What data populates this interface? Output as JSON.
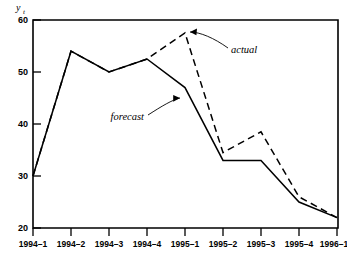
{
  "chart_data": {
    "type": "line",
    "title": "",
    "xlabel": "",
    "ylabel": "y_t",
    "ylabel_display": "y",
    "ylabel_subscript": "t",
    "categories": [
      "1994-1",
      "1994-2",
      "1994-3",
      "1994-4",
      "1995-1",
      "1995-2",
      "1995-3",
      "1995-4",
      "1996-1"
    ],
    "x_tick_labels": [
      "1994–1",
      "1994–2",
      "1994–3",
      "1994–4",
      "1995–1",
      "1995–2",
      "1995–3",
      "1995–4",
      "1996–1"
    ],
    "y_tick_labels": [
      "20",
      "30",
      "40",
      "50",
      "60"
    ],
    "y_tick_values": [
      20,
      30,
      40,
      50,
      60
    ],
    "ylim": [
      20,
      60
    ],
    "grid": false,
    "legend": "inline-annotations",
    "series": [
      {
        "name": "forecast",
        "style": "solid",
        "color": "#000000",
        "values": [
          30,
          54,
          50,
          52.5,
          47,
          33,
          33,
          25,
          22
        ]
      },
      {
        "name": "actual",
        "style": "dashed",
        "color": "#000000",
        "values": [
          30,
          54,
          50,
          52.5,
          57.5,
          34.5,
          38.5,
          26,
          22
        ]
      }
    ],
    "annotations": [
      {
        "name": "actual",
        "label": "actual",
        "points_to": "1995-1 on dashed series"
      },
      {
        "name": "forecast",
        "label": "forecast",
        "points_to": "1995-1 on solid series"
      }
    ]
  },
  "axis": {
    "y_title": "y",
    "y_title_sub": "t",
    "y_ticks": [
      "60",
      "50",
      "40",
      "30",
      "20"
    ],
    "x_ticks": [
      "1994–1",
      "1994–2",
      "1994–3",
      "1994–4",
      "1995–1",
      "1995–2",
      "1995–3",
      "1995–4",
      "1996–1"
    ]
  },
  "labels": {
    "actual": "actual",
    "forecast": "forecast"
  }
}
